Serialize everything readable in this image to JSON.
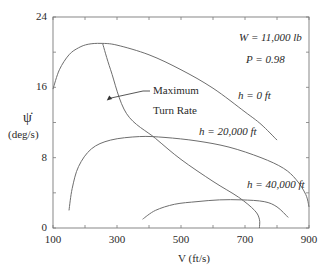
{
  "chart_data": {
    "type": "line",
    "title": "",
    "xlabel": "V (ft/s)",
    "ylabel": "ψ̇ (deg/s)",
    "ylabel_symbol": "ψ̇",
    "ylabel_units": "(deg/s)",
    "xlim": [
      100,
      900
    ],
    "ylim": [
      0,
      24
    ],
    "xticks": [
      100,
      300,
      500,
      700,
      900
    ],
    "yticks": [
      0,
      8,
      16,
      24
    ],
    "grid": false,
    "annotations": [
      {
        "text": "W = 11,000 lb"
      },
      {
        "text": "P = 0.98"
      },
      {
        "text": "Maximum Turn Rate",
        "line1": "Maximum",
        "line2": "Turn Rate",
        "arrow_to": [
          268,
          14.5
        ]
      }
    ],
    "series": [
      {
        "name": "h = 0 ft",
        "label": "h = 0 ft",
        "x": [
          100,
          120,
          150,
          180,
          210,
          250,
          300,
          400,
          500,
          600,
          700,
          750,
          800
        ],
        "y": [
          15.8,
          18.0,
          19.7,
          20.5,
          20.9,
          21.0,
          20.8,
          19.7,
          18.0,
          15.9,
          13.2,
          11.8,
          10.0
        ]
      },
      {
        "name": "h = 20,000 ft",
        "label": "h = 20,000 ft",
        "x": [
          150,
          160,
          180,
          220,
          280,
          370,
          450,
          550,
          650,
          750,
          820,
          860,
          890,
          900
        ],
        "y": [
          2.0,
          4.5,
          7.0,
          9.0,
          10.0,
          10.4,
          10.3,
          9.9,
          9.2,
          8.0,
          6.8,
          5.5,
          3.8,
          2.4
        ]
      },
      {
        "name": "h = 40,000 ft",
        "label": "h = 40,000 ft",
        "x": [
          380,
          420,
          480,
          550,
          620,
          690,
          760,
          800,
          835
        ],
        "y": [
          1.0,
          2.0,
          2.7,
          3.0,
          3.2,
          3.2,
          3.0,
          2.4,
          1.2
        ]
      },
      {
        "name": "Maximum Turn Rate",
        "label": "Maximum Turn Rate",
        "x": [
          255,
          280,
          330,
          420,
          500,
          600,
          680,
          730,
          745,
          745
        ],
        "y": [
          21.0,
          18.0,
          13.0,
          10.2,
          7.8,
          5.3,
          3.5,
          2.0,
          1.0,
          0.0
        ]
      }
    ]
  },
  "labels": {
    "weight": "W = 11,000 lb",
    "power": "P = 0.98",
    "max_line1": "Maximum",
    "max_line2": "Turn Rate",
    "h0": "h = 0 ft",
    "h20": "h = 20,000 ft",
    "h40": "h = 40,000 ft",
    "ylabel_symbol": "ψ̇",
    "ylabel_units": "(deg/s)",
    "xlabel": "V (ft/s)"
  },
  "colors": {
    "axis": "#7a7a7a",
    "curve": "#6e6e6e",
    "text": "#2a2a2a"
  }
}
